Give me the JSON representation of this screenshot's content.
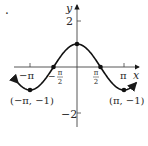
{
  "marker": ".",
  "chart_data": {
    "type": "line",
    "title": "",
    "function": "y = cos(x)",
    "xlabel": "x",
    "ylabel": "y",
    "x_ticks": [
      "−π",
      "−π/2",
      "π/2",
      "π"
    ],
    "y_ticks": [
      "2",
      "−2"
    ],
    "xlim": [
      -3.6,
      3.6
    ],
    "ylim": [
      -2.6,
      2.6
    ],
    "points": [
      {
        "x": -3.1416,
        "y": -1,
        "label": "(−π, −1)"
      },
      {
        "x": -1.5708,
        "y": 0,
        "label": ""
      },
      {
        "x": 0,
        "y": 1,
        "label": ""
      },
      {
        "x": 1.5708,
        "y": 0,
        "label": ""
      },
      {
        "x": 3.1416,
        "y": -1,
        "label": "(π, −1)"
      }
    ],
    "grid": false,
    "curve_arrows": "both ends"
  },
  "labels": {
    "y_axis": "y",
    "x_axis": "x",
    "y_tick_2": "2",
    "y_tick_neg2": "−2",
    "x_tick_neg_pi": "−π",
    "x_tick_pi": "π",
    "x_tick_neg_half_minus": "−",
    "half_pi_num": "π",
    "half_pi_den": "2",
    "point_left": "(−π, −1)",
    "point_right": "(π, −1)"
  }
}
